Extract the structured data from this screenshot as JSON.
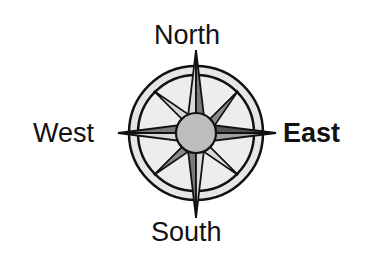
{
  "diagram": {
    "type": "compass-rose",
    "labels": {
      "north": "North",
      "south": "South",
      "west": "West",
      "east": "East"
    },
    "emphasized_direction": "East",
    "colors": {
      "background": "#ffffff",
      "stroke": "#111111",
      "ring_fill": "#e6e6e6",
      "center_fill": "#bdbdbd",
      "point_light": "#d9d9d9",
      "point_dark": "#7a7a7a",
      "east_highlight": "#555555"
    }
  }
}
